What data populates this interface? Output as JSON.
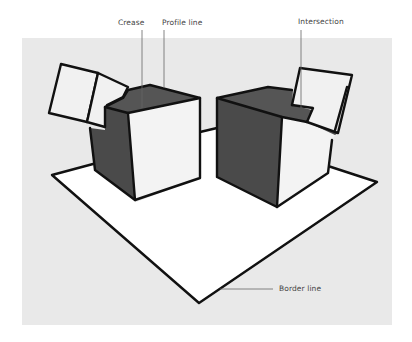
{
  "figure": {
    "type": "line-drawing illustration",
    "colors": {
      "background": "#ffffff",
      "panel": "#e9e9e9",
      "dark_face": "#4a4a4a",
      "light_face": "#f3f3f3",
      "plane": "#ffffff",
      "stroke": "#111111",
      "leader": "#666666",
      "label_text": "#444444"
    }
  },
  "labels": {
    "crease": "Crease",
    "profile_line": "Profile line",
    "intersection": "Intersection",
    "border_line": "Border line"
  }
}
